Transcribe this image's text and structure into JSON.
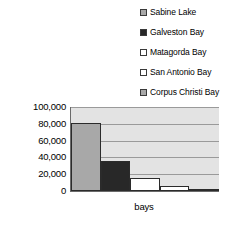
{
  "chart_data": {
    "type": "bar",
    "title": "",
    "xlabel": "bays",
    "ylabel": "acres",
    "categories": [
      "Sabine Lake",
      "Galveston Bay",
      "Matagorda Bay",
      "San Antonio Bay",
      "Corpus Christi Bay"
    ],
    "values": [
      81000,
      36000,
      16000,
      6000,
      1500
    ],
    "ylim": [
      0,
      100000
    ],
    "ytick_labels": [
      "100,000",
      "80,000",
      "60,000",
      "40,000",
      "20,000",
      "0"
    ],
    "ytick_values": [
      100000,
      80000,
      60000,
      40000,
      20000,
      0
    ],
    "grid": true,
    "legend_position": "top-right",
    "plot_background": "#e3e3e3",
    "series_colors": [
      "#a8a8a8",
      "#282828",
      "#ffffff",
      "#ffffff",
      "#a8a8a8"
    ],
    "legend": [
      {
        "label": "Sabine Lake",
        "swatch": "#a8a8a8",
        "icon": "legend-swatch-icon"
      },
      {
        "label": "Galveston Bay",
        "swatch": "#282828",
        "icon": "legend-swatch-icon"
      },
      {
        "label": "Matagorda Bay",
        "swatch": "#ffffff",
        "icon": "legend-swatch-icon"
      },
      {
        "label": "San Antonio Bay",
        "swatch": "#ffffff",
        "icon": "legend-swatch-icon"
      },
      {
        "label": "Corpus Christi Bay",
        "swatch": "#a8a8a8",
        "icon": "legend-swatch-icon"
      }
    ]
  }
}
